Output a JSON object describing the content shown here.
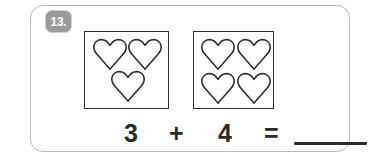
{
  "worksheet": {
    "question_number": "13.",
    "card_border_color": "#b9b9b9",
    "badge_color": "#9a9a9a",
    "ink_color": "#2e2e2e"
  },
  "groups": [
    {
      "name": "left-group",
      "icon": "heart-icon",
      "count": 3,
      "positions": [
        {
          "x": 7,
          "y": 6
        },
        {
          "x": 42,
          "y": 6
        },
        {
          "x": 25,
          "y": 38
        }
      ]
    },
    {
      "name": "right-group",
      "icon": "heart-icon",
      "count": 4,
      "positions": [
        {
          "x": 6,
          "y": 6
        },
        {
          "x": 42,
          "y": 6
        },
        {
          "x": 6,
          "y": 40
        },
        {
          "x": 42,
          "y": 40
        }
      ]
    }
  ],
  "equation": {
    "addend_1": "3",
    "operator": "+",
    "addend_2": "4",
    "equals": "=",
    "answer": ""
  }
}
